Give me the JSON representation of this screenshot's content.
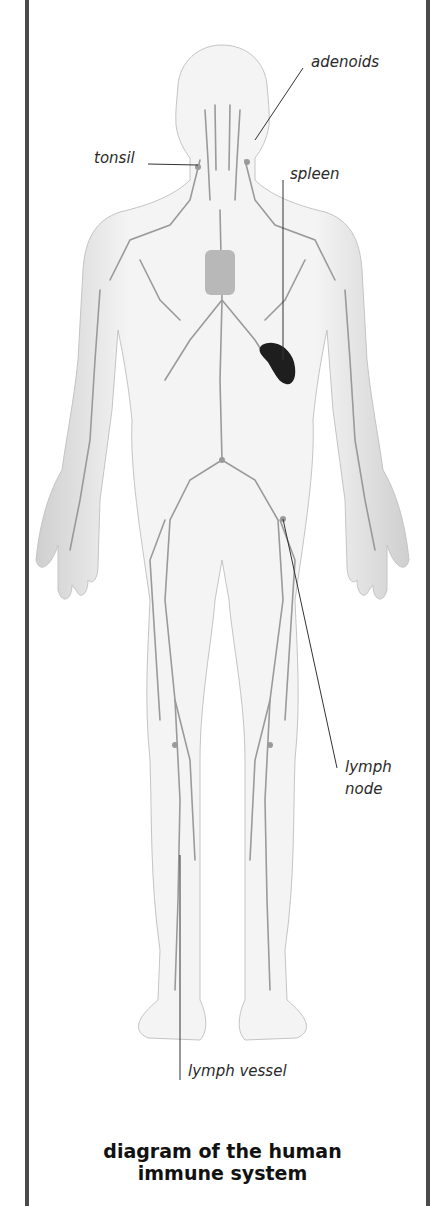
{
  "diagram": {
    "labels": {
      "adenoids": "adenoids",
      "tonsil": "tonsil",
      "spleen": "spleen",
      "lymph_node": [
        "lymph",
        "node"
      ],
      "lymph_vessel": "lymph vessel"
    },
    "caption": [
      "diagram of the human",
      "immune system"
    ],
    "colors": {
      "frame": "#4a4a4a",
      "body_fill": "#ececec",
      "vessel": "#9a9a9a",
      "spleen": "#1e1e1e",
      "leader_line": "#333333"
    }
  }
}
